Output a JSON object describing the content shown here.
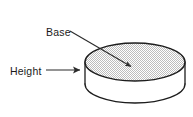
{
  "figure": {
    "background_color": "#ffffff",
    "outline_color": "#1c1c1c",
    "leader_color": "#2b2b2b",
    "fill_pattern": "stipple-dots",
    "fill_color": "#d9d9d9",
    "width": 193,
    "height": 117
  },
  "labels": {
    "base": {
      "text": "Base",
      "x": 46,
      "y": 36
    },
    "height": {
      "text": "Height",
      "x": 10,
      "y": 75
    }
  },
  "leaders": {
    "base": {
      "from_x": 70,
      "from_y": 31,
      "to_x": 135,
      "to_y": 69
    },
    "height": {
      "from_x": 46,
      "from_y": 70,
      "to_x": 85,
      "to_y": 70
    }
  },
  "shape": {
    "type": "cylinder",
    "top_center_x": 135,
    "top_center_y": 62,
    "radius_x": 50,
    "radius_y": 19,
    "body_height": 22
  }
}
